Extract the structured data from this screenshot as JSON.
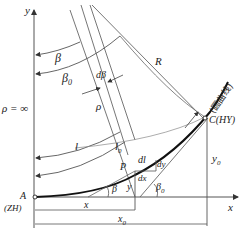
{
  "diagram": {
    "type": "transition-curve-geometry",
    "axes": {
      "x_label": "x",
      "y_label": "y",
      "origin_label": "A",
      "origin_code": "(ZH)"
    },
    "labels": {
      "rho_inf": "ρ = ∞",
      "beta": "β",
      "beta0": "β",
      "beta0_sub": "0",
      "dbeta": "dβ",
      "rho": "ρ",
      "R": "R",
      "l": "l",
      "l0": "l",
      "l0_sub": "0",
      "P": "P",
      "dl": "dl",
      "dy": "dy",
      "dx": "dx",
      "x": "x",
      "y": "y",
      "y0": "y",
      "y0_sub": "0",
      "x0": "x",
      "x0_sub": "0",
      "point_C": "C(HY)",
      "circular_curve": "(圆曲线)",
      "beta_small": "β",
      "beta0_small": "β",
      "beta0_small_sub": "0"
    },
    "colors": {
      "line": "#555555",
      "curve": "#111111",
      "text": "#222222"
    }
  }
}
